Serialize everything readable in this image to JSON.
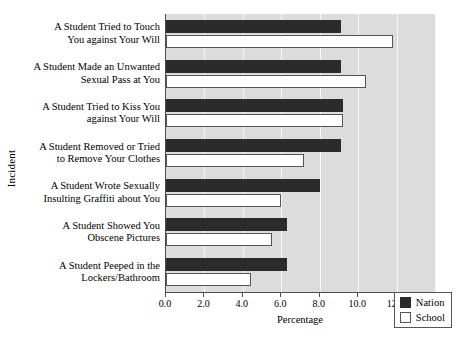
{
  "chart_data": {
    "type": "bar",
    "orientation": "horizontal",
    "title": "",
    "xlabel": "Percentage",
    "ylabel": "Incident",
    "xlim": [
      0.0,
      14.0
    ],
    "xticks": [
      "0.0",
      "2.0",
      "4.0",
      "6.0",
      "8.0",
      "10.0",
      "12.0",
      "14.0"
    ],
    "xtick_values": [
      0.0,
      2.0,
      4.0,
      6.0,
      8.0,
      10.0,
      12.0,
      14.0
    ],
    "grid": true,
    "legend_position": "lower right",
    "categories": [
      "A Student Tried to Touch You against Your Will",
      "A Student Made an Unwanted Sexual Pass at You",
      "A Student Tried to Kiss You against Your Will",
      "A Student Removed or Tried to Remove Your Clothes",
      "A Student Wrote Sexually Insulting Graffiti about You",
      "A Student Showed You Obscene Pictures",
      "A Student Peeped in the Lockers/Bathroom"
    ],
    "category_lines": [
      [
        "A Student Tried to Touch",
        "You against Your Will"
      ],
      [
        "A Student Made an Unwanted",
        "Sexual Pass at You"
      ],
      [
        "A Student Tried to Kiss You",
        "against Your Will"
      ],
      [
        "A Student Removed or Tried",
        "to Remove Your Clothes"
      ],
      [
        "A Student Wrote Sexually",
        "Insulting Graffiti about You"
      ],
      [
        "A Student Showed You",
        "Obscene Pictures"
      ],
      [
        "A Student Peeped in the",
        "Lockers/Bathroom"
      ]
    ],
    "series": [
      {
        "name": "Nation",
        "color": "#2b2b2b",
        "values": [
          9.1,
          9.1,
          9.2,
          9.1,
          8.0,
          6.3,
          6.3
        ]
      },
      {
        "name": "School",
        "color": "#ffffff",
        "values": [
          11.8,
          10.4,
          9.2,
          7.2,
          6.0,
          5.5,
          4.4
        ]
      }
    ]
  },
  "legend": {
    "items": [
      {
        "label": "Nation",
        "swatch": "nation"
      },
      {
        "label": "School",
        "swatch": "school"
      }
    ]
  }
}
